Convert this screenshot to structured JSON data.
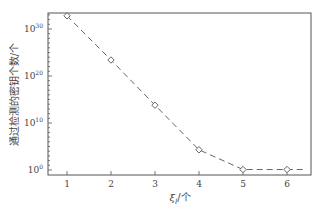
{
  "chart_data": {
    "type": "line",
    "title": "",
    "xlabel": "ξ_l/个",
    "xlabel_parts": {
      "symbol": "ξ",
      "subscript": "l",
      "unit": "/个"
    },
    "ylabel": "通过检测的密钥个数/个",
    "yscale": "log",
    "x": [
      1,
      2,
      3,
      4,
      5,
      6
    ],
    "series": [
      {
        "name": "通过检测的密钥个数",
        "values": [
          1e+33,
          1e+23,
          100000000000000.0,
          10000.0,
          1,
          1
        ],
        "log10_values": [
          32.8,
          23.4,
          13.8,
          4.3,
          0.1,
          0.1
        ],
        "line_style": "dashed",
        "marker": "open-diamond",
        "color": "#666666"
      }
    ],
    "xticks": [
      "1",
      "2",
      "3",
      "4",
      "5",
      "6"
    ],
    "yticks": [
      {
        "base": "10",
        "exp": "0"
      },
      {
        "base": "10",
        "exp": "10"
      },
      {
        "base": "10",
        "exp": "20"
      },
      {
        "base": "10",
        "exp": "30"
      }
    ],
    "xlim": [
      0.6,
      6.6
    ],
    "ylim_log10": [
      -1,
      33.5
    ],
    "grid": false,
    "legend": null,
    "trailing_segment": {
      "from_x": 6,
      "to_x": 6.45,
      "log10_value": 0.1
    }
  }
}
